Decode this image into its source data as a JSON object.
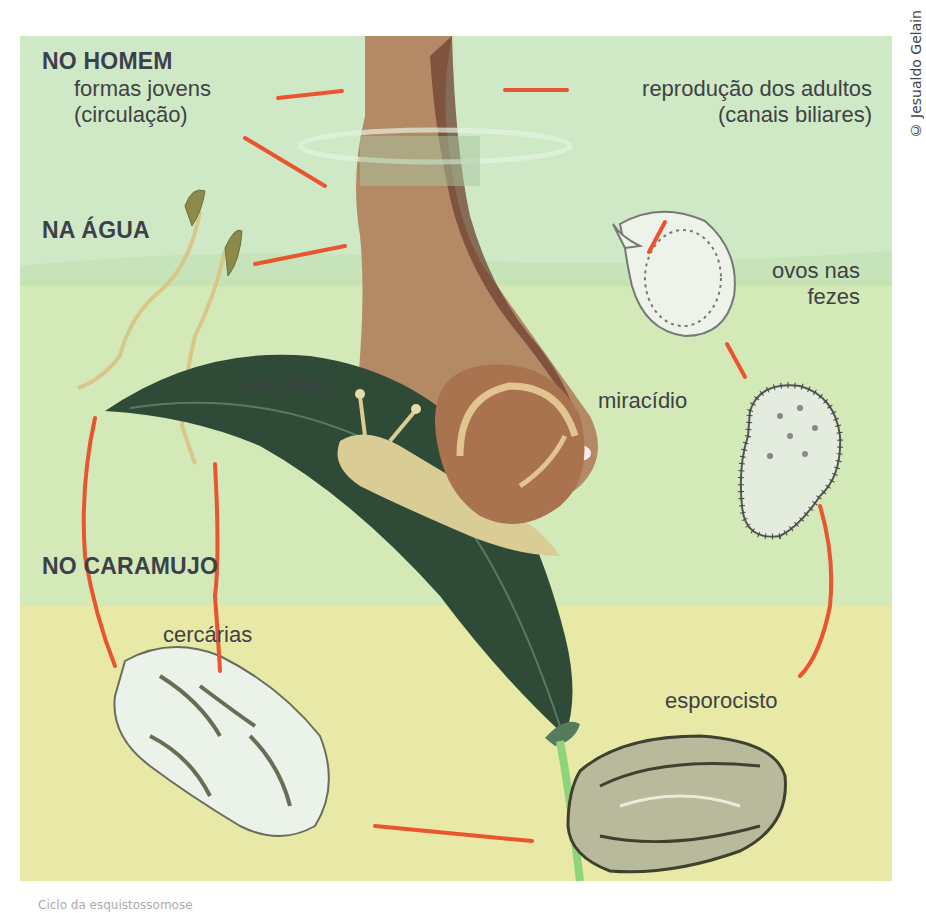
{
  "credit": "© Jesualdo Gelain",
  "zones": {
    "human": "NO HOMEM",
    "water": "NA ÁGUA",
    "snail": "NO CARAMUJO"
  },
  "labels": {
    "young_forms_line1": "formas jovens",
    "young_forms_line2": "(circulação)",
    "adult_reproduction_line1": "reprodução dos adultos",
    "adult_reproduction_line2": "(canais biliares)",
    "eggs_line1": "ovos nas",
    "eggs_line2": "fezes",
    "miracidium": "miracídio",
    "cercariae_water": "cercárias",
    "cercariae_snail": "cercárias",
    "sporocyst": "esporocisto"
  },
  "caption": "Ciclo da esquistossomose",
  "colors": {
    "human_zone": "#cfe9c6",
    "water_zone": "#d3e9b7",
    "snail_zone": "#e8e9a6",
    "arrow_line": "#e8552f",
    "text": "#3f4145"
  }
}
